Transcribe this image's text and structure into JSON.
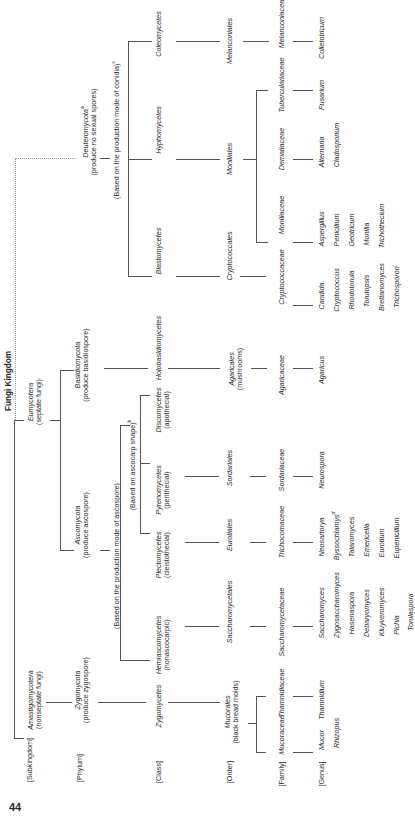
{
  "title": "Fungi Kingdom",
  "page_number": "44",
  "ranks": [
    "[Subkingdom]",
    "[Phylum]",
    "[Class]",
    "[Order]",
    "[Family]",
    "[Genus]"
  ],
  "subkingdoms": {
    "amastigomycotera": {
      "name": "Amastigomycotera",
      "note": "(nonseptate fungi)"
    },
    "eumycotera": {
      "name": "Eumycotera",
      "note": "(septate fungi)"
    }
  },
  "phyla": {
    "zygomycota": {
      "name": "Zygomycota",
      "note": "(produce zygospore)"
    },
    "ascomycota": {
      "name": "Ascomycota",
      "note": "(produce ascospore)"
    },
    "basidiomycota": {
      "name": "Basidiomycota",
      "note": "(produce basidiospore)"
    },
    "deuteromycota": {
      "name": "Deuteromycota",
      "sup": "a",
      "note": "(produce no sexual spores)"
    }
  },
  "criteria": {
    "ascospore": "(Based on the production mode of ascospore)",
    "ascocarp": "(Based on ascocarp shape)",
    "ascocarp_sup": "b",
    "conidia": "(Based on the production mode of conidia)",
    "conidia_sup": "c"
  },
  "classes": {
    "zygomycetes": "Zygomycetes",
    "hemiascomycetes": {
      "name": "Hemiascomycetes",
      "note": "(nonascocarpic)"
    },
    "plectomycetes": {
      "name": "Plectomycetes",
      "note": "(cleistothecial)"
    },
    "pyrenomycetes": {
      "name": "Pyrenomycetes",
      "note": "(perithecial)"
    },
    "discomycetes": {
      "name": "Discomycetes",
      "note": "(apothecial)"
    },
    "holobasidiomycetes": "Holobasidiomycetes",
    "blastomycetes": "Blastomycetes",
    "hyphomycetes": "Hyphomycetes",
    "coleomycetes": "Coleomycetes"
  },
  "orders": {
    "mucorales": {
      "name": "Mucorales",
      "note": "(black bread molds)"
    },
    "saccharomycetales": "Saccharomycetales",
    "eurotiales": "Eurotiales",
    "sordariales": "Sordariales",
    "agaricales": {
      "name": "Agaricales",
      "note": "(mushrooms)"
    },
    "cryptococcales": "Cryptococcales",
    "moniliales": "Moniliales",
    "melanconiales": "Melanconiales"
  },
  "families": {
    "mucoraceae": "Mucoraceae",
    "thamnidiaceae": "Thamnidiaceae",
    "saccharomycetaceae": "Saccharomycetaceae",
    "trichocomaceae": "Trichocomaceae",
    "sordariaceae": "Sordariaceae",
    "agaricaceae": "Agaricaceae",
    "cryptococcaceae": "Cryptococcaceae",
    "moniliaceae": "Moniliaceae",
    "dematiaceae": "Dematiaceae",
    "tuberculariaceae": "Tuberculariaceae",
    "melanconiaceae": "Melanconiaceae"
  },
  "genera": {
    "mucoraceae": [
      "Mucor",
      "Rhizopus"
    ],
    "thamnidiaceae": [
      "Thamnidium"
    ],
    "saccharomycetaceae": [
      "Saccharomyces",
      "Zygosaccharomyces",
      "Hasenaspora",
      "Debaryomyces",
      "Kluyveromyces",
      "Pichia",
      "Torulaspora"
    ],
    "trichocomaceae": [
      "Neosartorya",
      "Byssochlamys",
      "Talaromyces",
      "Emericella",
      "Eurotium",
      "Eupenicillum"
    ],
    "trichocomaceae_sup": "d",
    "sordariaceae": [
      "Neurospora"
    ],
    "agaricaceae": [
      "Agaricus"
    ],
    "cryptococcaceae": [
      "Candida",
      "Cryptococcus",
      "Rhodotorula",
      "Torulopsis",
      "Brettanomyces",
      "Trichosporon"
    ],
    "moniliaceae": [
      "Aspergillus",
      "Penicilium",
      "Geotricum",
      "Monilia",
      "Trichothecium"
    ],
    "dematiaceae": [
      "Alternaria",
      "Cladosporium"
    ],
    "tuberculariaceae": [
      "Fusarium"
    ],
    "melanconiaceae": [
      "Colletotricum"
    ]
  }
}
